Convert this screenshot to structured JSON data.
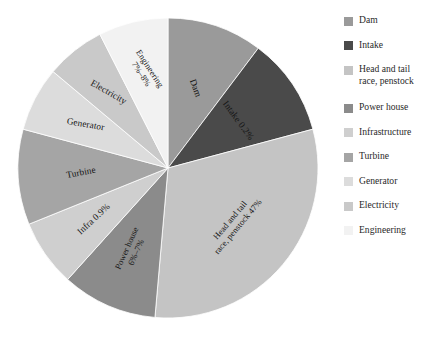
{
  "chart_data": {
    "type": "pie",
    "title": "",
    "subtitle": "",
    "xlabel": "",
    "ylabel": "",
    "grid": false,
    "legend_position": "right",
    "center": {
      "x": 152,
      "y": 152
    },
    "radius": 150,
    "start_angle_deg": 0,
    "direction": "clockwise",
    "categories": [
      "Dam",
      "Intake",
      "Head and tail race, penstock",
      "Power house",
      "Infrastructure",
      "Turbine",
      "Generator",
      "Electricity",
      "Engineering"
    ],
    "slices": [
      {
        "name": "Dam",
        "legend_label": "Dam",
        "slice_label": "Dam",
        "value_text": "",
        "value": 10.3,
        "sweep_deg": 37,
        "start_deg": 0,
        "end_deg": 37,
        "color": "#9a9a9a",
        "label_radius_frac": 0.56,
        "label_rotation_deg": 70,
        "lines": 1
      },
      {
        "name": "Intake",
        "legend_label": "Intake",
        "slice_label": "Intake 0.2%",
        "value_text": "0.2%",
        "value": 0.2,
        "sweep_deg": 38,
        "start_deg": 37,
        "end_deg": 75,
        "color": "#4a4a4a",
        "label_radius_frac": 0.56,
        "label_rotation_deg": 54,
        "lines": 1
      },
      {
        "name": "Head and tail race, penstock",
        "legend_label": "Head and tail\nrace, penstock",
        "slice_label": "Head and tail\nrace, penstock 47%",
        "value_text": "47%",
        "value": 47,
        "sweep_deg": 110,
        "start_deg": 75,
        "end_deg": 185,
        "color": "#c4c4c4",
        "label_radius_frac": 0.58,
        "label_rotation_deg": -50,
        "lines": 2
      },
      {
        "name": "Power house",
        "legend_label": "Power house",
        "slice_label": "Power house\n6%–7%",
        "value_text": "6%–7%",
        "value": 6.5,
        "sweep_deg": 37,
        "start_deg": 185,
        "end_deg": 222,
        "color": "#8b8b8b",
        "label_radius_frac": 0.6,
        "label_rotation_deg": -66,
        "lines": 2
      },
      {
        "name": "Infrastructure",
        "legend_label": "Infrastructure",
        "slice_label": "Infra 0.9%",
        "value_text": "0.9%",
        "value": 0.9,
        "sweep_deg": 26,
        "start_deg": 222,
        "end_deg": 248,
        "color": "#cfcfcf",
        "label_radius_frac": 0.6,
        "label_rotation_deg": -43,
        "lines": 1
      },
      {
        "name": "Turbine",
        "legend_label": "Turbine",
        "slice_label": "Turbine",
        "value_text": "",
        "value": 10.3,
        "sweep_deg": 37,
        "start_deg": 248,
        "end_deg": 285,
        "color": "#a5a5a5",
        "label_radius_frac": 0.58,
        "label_rotation_deg": -11,
        "lines": 1
      },
      {
        "name": "Generator",
        "legend_label": "Generator",
        "slice_label": "Generator",
        "value_text": "",
        "value": 7,
        "sweep_deg": 25,
        "start_deg": 285,
        "end_deg": 310,
        "color": "#dcdcdc",
        "label_radius_frac": 0.62,
        "label_rotation_deg": 10,
        "lines": 1
      },
      {
        "name": "Electricity",
        "legend_label": "Electricity",
        "slice_label": "Electricity",
        "value_text": "",
        "value": 6.4,
        "sweep_deg": 23,
        "start_deg": 310,
        "end_deg": 333,
        "color": "#c9c9c9",
        "label_radius_frac": 0.64,
        "label_rotation_deg": 30,
        "lines": 1
      },
      {
        "name": "Engineering",
        "legend_label": "Engineering",
        "slice_label": "Engineering\n7%–8%",
        "value_text": "7%–8%",
        "value": 7.5,
        "sweep_deg": 27,
        "start_deg": 333,
        "end_deg": 360,
        "color": "#f2f2f2",
        "label_radius_frac": 0.66,
        "label_rotation_deg": 57,
        "lines": 2
      }
    ]
  },
  "legend": {
    "items": [
      {
        "label": "Dam",
        "color": "#9a9a9a"
      },
      {
        "label": "Intake",
        "color": "#4a4a4a"
      },
      {
        "label": "Head and tail\nrace, penstock",
        "color": "#c4c4c4"
      },
      {
        "label": "Power house",
        "color": "#8b8b8b"
      },
      {
        "label": "Infrastructure",
        "color": "#cfcfcf"
      },
      {
        "label": "Turbine",
        "color": "#a5a5a5"
      },
      {
        "label": "Generator",
        "color": "#dcdcdc"
      },
      {
        "label": "Electricity",
        "color": "#c9c9c9"
      },
      {
        "label": "Engineering",
        "color": "#f2f2f2"
      }
    ]
  },
  "style": {
    "background": "#ffffff",
    "slice_stroke": "#ffffff",
    "label_color": "#151515"
  }
}
